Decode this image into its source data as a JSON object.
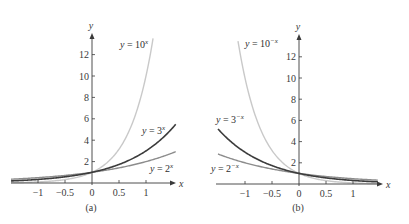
{
  "colors": {
    "axis": "#3a3a3a",
    "text": "#333333",
    "light_curve": "#c9c9c9",
    "dark_curve": "#3c3c3c",
    "mid_curve": "#8c8c8c",
    "background": "#ffffff"
  },
  "chart_data": [
    {
      "type": "line",
      "panel_label": "(a)",
      "xlabel": "x",
      "ylabel": "y",
      "xlim": [
        -1.5,
        1.55
      ],
      "ylim": [
        0,
        14
      ],
      "grid": false,
      "legend": "inline labels next to curves",
      "x_ticks": [
        -1,
        -0.5,
        0,
        0.5,
        1
      ],
      "x_tick_labels": [
        "−1",
        "−0.5",
        "0",
        "0.5",
        "1"
      ],
      "y_ticks": [
        2,
        4,
        6,
        8,
        10,
        12
      ],
      "y_tick_labels": [
        "2",
        "4",
        "6",
        "8",
        "10",
        "12"
      ],
      "series": [
        {
          "name": "y = 10^x",
          "label_main": "y = 10",
          "label_sup": "x",
          "base": 10,
          "sign": 1,
          "color_key": "light_curve",
          "x": [
            -1.5,
            -1,
            -0.5,
            0,
            0.5,
            1,
            1.146
          ],
          "values": [
            0.03,
            0.1,
            0.32,
            1,
            3.16,
            10,
            14
          ]
        },
        {
          "name": "y = 3^x",
          "label_main": "y = 3",
          "label_sup": "x",
          "base": 3,
          "sign": 1,
          "color_key": "dark_curve",
          "x": [
            -1.5,
            -1,
            -0.5,
            0,
            0.5,
            1,
            1.53
          ],
          "values": [
            0.19,
            0.33,
            0.58,
            1,
            1.73,
            3,
            5.37
          ]
        },
        {
          "name": "y = 2^x",
          "label_main": "y = 2",
          "label_sup": "x",
          "base": 2,
          "sign": 1,
          "color_key": "mid_curve",
          "x": [
            -1.5,
            -1,
            -0.5,
            0,
            0.5,
            1,
            1.53
          ],
          "values": [
            0.35,
            0.5,
            0.71,
            1,
            1.41,
            2,
            2.89
          ]
        }
      ]
    },
    {
      "type": "line",
      "panel_label": "(b)",
      "xlabel": "x",
      "ylabel": "y",
      "xlim": [
        -1.5,
        1.46
      ],
      "ylim": [
        0,
        14
      ],
      "grid": false,
      "legend": "inline labels next to curves",
      "x_ticks": [
        -1,
        -0.5,
        0,
        0.5,
        1
      ],
      "x_tick_labels": [
        "−1",
        "−0.5",
        "0",
        "0.5",
        "1"
      ],
      "y_ticks": [
        2,
        4,
        6,
        8,
        10,
        12
      ],
      "y_tick_labels": [
        "2",
        "4",
        "6",
        "8",
        "10",
        "12"
      ],
      "series": [
        {
          "name": "y = 10^-x",
          "label_main": "y = 10",
          "label_sup": "−x",
          "base": 10,
          "sign": -1,
          "color_key": "light_curve",
          "x": [
            -1.146,
            -1,
            -0.5,
            0,
            0.5,
            1,
            1.46
          ],
          "values": [
            14,
            10,
            3.16,
            1,
            0.32,
            0.1,
            0.03
          ]
        },
        {
          "name": "y = 3^-x",
          "label_main": "y = 3",
          "label_sup": "−x",
          "base": 3,
          "sign": -1,
          "color_key": "dark_curve",
          "x": [
            -1.5,
            -1,
            -0.5,
            0,
            0.5,
            1,
            1.46
          ],
          "values": [
            5.2,
            3,
            1.73,
            1,
            0.58,
            0.33,
            0.2
          ]
        },
        {
          "name": "y = 2^-x",
          "label_main": "y = 2",
          "label_sup": "−x",
          "base": 2,
          "sign": -1,
          "color_key": "mid_curve",
          "x": [
            -1.5,
            -1,
            -0.5,
            0,
            0.5,
            1,
            1.46
          ],
          "values": [
            2.83,
            2,
            1.41,
            1,
            0.71,
            0.5,
            0.36
          ]
        }
      ]
    }
  ]
}
